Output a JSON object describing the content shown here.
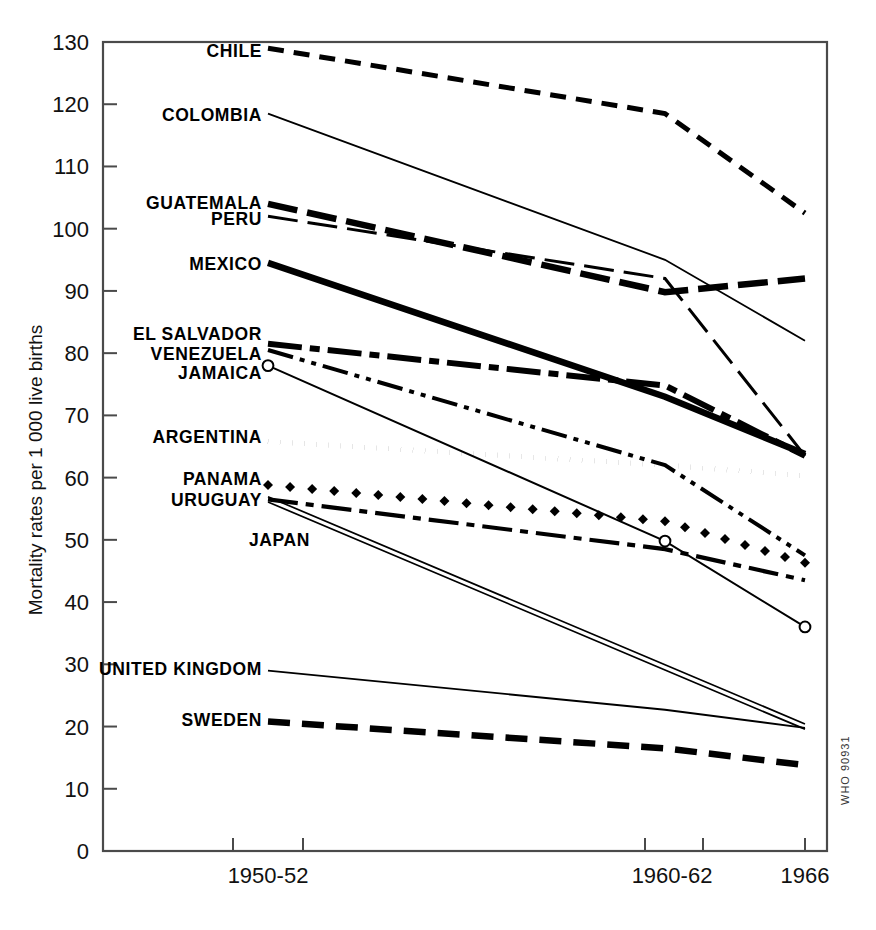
{
  "figure": {
    "who_code": "WHO 90931",
    "y_axis_title": "Mortality rates per 1 000 live births"
  },
  "chart_data": {
    "type": "line",
    "title": "",
    "subtitle": "",
    "xlabel": "",
    "ylabel": "Mortality rates per 1 000 live births",
    "x": [
      "1950-52",
      "1960-62",
      "1966"
    ],
    "xtick_labels": [
      "1950-52",
      "1960-62",
      "1966"
    ],
    "ytick_labels": [
      "0",
      "10",
      "20",
      "30",
      "40",
      "50",
      "60",
      "70",
      "80",
      "90",
      "100",
      "110",
      "120",
      "130"
    ],
    "yticks": [
      0,
      10,
      20,
      30,
      40,
      50,
      60,
      70,
      80,
      90,
      100,
      110,
      120,
      130
    ],
    "ylim": [
      0,
      130
    ],
    "grid": false,
    "legend": "inline-labels-left",
    "annotations": [
      "WHO 90931"
    ],
    "series": [
      {
        "name": "CHILE",
        "values": [
          129.0,
          118.5,
          102.5
        ],
        "label_x": 1950,
        "label_y": 128,
        "style": "dashed-medium"
      },
      {
        "name": "COLOMBIA",
        "values": [
          118.5,
          95.0,
          82.0
        ],
        "label_x": 1950,
        "label_y": 118,
        "style": "thin-solid"
      },
      {
        "name": "GUATEMALA",
        "values": [
          104.0,
          89.8,
          92.0
        ],
        "label_x": 1950,
        "label_y": 104,
        "style": "long-dash-thick"
      },
      {
        "name": "PERU",
        "values": [
          102.0,
          92.0,
          63.5
        ],
        "label_x": 1950,
        "label_y": 101.5,
        "style": "long-dash-thin"
      },
      {
        "name": "MEXICO",
        "values": [
          94.5,
          73.0,
          63.8
        ],
        "label_x": 1950,
        "label_y": 94,
        "style": "thick-solid"
      },
      {
        "name": "EL SALVADOR",
        "values": [
          81.5,
          74.8,
          63.5
        ],
        "label_x": 1950,
        "label_y": 82.5,
        "style": "thick-dash-dot"
      },
      {
        "name": "VENEZUELA",
        "values": [
          80.5,
          62.0,
          47.5
        ],
        "label_x": 1950,
        "label_y": 79.5,
        "style": "dash-double-dot"
      },
      {
        "name": "JAMAICA",
        "values": [
          78.0,
          49.8,
          36.0
        ],
        "label_x": 1950,
        "label_y": 77.0,
        "style": "thin-solid-circles"
      },
      {
        "name": "ARGENTINA",
        "values": [
          65.8,
          62.0,
          60.3
        ],
        "label_x": 1950,
        "label_y": 66.5,
        "style": "dotted-round"
      },
      {
        "name": "PANAMA",
        "values": [
          58.8,
          53.0,
          46.3
        ],
        "label_x": 1950,
        "label_y": 59.5,
        "style": "dotted-diamond"
      },
      {
        "name": "URUGUAY",
        "values": [
          56.5,
          48.5,
          43.5
        ],
        "label_x": 1950,
        "label_y": 56.3,
        "style": "dash-dot-medium"
      },
      {
        "name": "JAPAN",
        "values": [
          56.5,
          29.5,
          20.0
        ],
        "label_x": 1950,
        "label_y": 50.5,
        "style": "double-rail"
      },
      {
        "name": "UNITED KINGDOM",
        "values": [
          29.0,
          22.7,
          19.8
        ],
        "label_x": 1950,
        "label_y": 29.3,
        "style": "thin-solid"
      },
      {
        "name": "SWEDEN",
        "values": [
          20.8,
          16.5,
          13.8
        ],
        "label_x": 1950,
        "label_y": 20.8,
        "style": "thick-dash"
      }
    ]
  }
}
